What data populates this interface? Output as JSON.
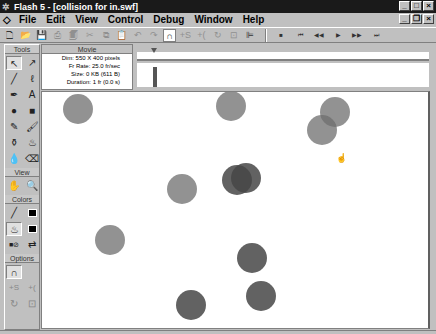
{
  "window": {
    "title": "Flash 5 - [collision for in.swf]",
    "controls": [
      "_",
      "□",
      "×"
    ],
    "doc_controls": [
      "_",
      "❐",
      "×"
    ]
  },
  "menu": {
    "items": [
      "File",
      "Edit",
      "View",
      "Control",
      "Debug",
      "Window",
      "Help"
    ]
  },
  "toolbar": {
    "buttons": [
      {
        "name": "new-icon",
        "glyph": "🗋"
      },
      {
        "name": "open-icon",
        "glyph": "📂"
      },
      {
        "name": "save-icon",
        "glyph": "💾"
      },
      {
        "name": "print-icon",
        "glyph": "⎙"
      },
      {
        "name": "print-preview-icon",
        "glyph": "🗐"
      },
      {
        "name": "cut-icon",
        "glyph": "✂"
      },
      {
        "name": "copy-icon",
        "glyph": "⧉"
      },
      {
        "name": "paste-icon",
        "glyph": "📋"
      },
      {
        "name": "undo-icon",
        "glyph": "↶"
      },
      {
        "name": "redo-icon",
        "glyph": "↷"
      },
      {
        "name": "snap-magnet-icon",
        "glyph": "∩"
      },
      {
        "name": "smooth-icon",
        "glyph": "+S"
      },
      {
        "name": "straighten-icon",
        "glyph": "+("
      },
      {
        "name": "rotate-icon",
        "glyph": "↻"
      },
      {
        "name": "scale-icon",
        "glyph": "⊡"
      },
      {
        "name": "align-icon",
        "glyph": "⊫"
      }
    ],
    "controller": [
      {
        "name": "stop-icon",
        "glyph": "■"
      },
      {
        "name": "rewind-icon",
        "glyph": "⏮"
      },
      {
        "name": "step-back-icon",
        "glyph": "◀◀"
      },
      {
        "name": "play-icon",
        "glyph": "▶"
      },
      {
        "name": "step-forward-icon",
        "glyph": "▶▶"
      },
      {
        "name": "go-to-end-icon",
        "glyph": "⏭"
      }
    ]
  },
  "tools": {
    "header": "Tools",
    "items": [
      {
        "name": "arrow-tool-icon",
        "glyph": "↖",
        "selected": true
      },
      {
        "name": "subselect-tool-icon",
        "glyph": "↗"
      },
      {
        "name": "line-tool-icon",
        "glyph": "╱"
      },
      {
        "name": "lasso-tool-icon",
        "glyph": "ℓ"
      },
      {
        "name": "pen-tool-icon",
        "glyph": "✒"
      },
      {
        "name": "text-tool-icon",
        "glyph": "A"
      },
      {
        "name": "oval-tool-icon",
        "glyph": "●"
      },
      {
        "name": "rectangle-tool-icon",
        "glyph": "■"
      },
      {
        "name": "pencil-tool-icon",
        "glyph": "✎"
      },
      {
        "name": "brush-tool-icon",
        "glyph": "🖌"
      },
      {
        "name": "ink-bottle-tool-icon",
        "glyph": "⚱"
      },
      {
        "name": "paint-bucket-tool-icon",
        "glyph": "♨"
      },
      {
        "name": "eyedropper-tool-icon",
        "glyph": "💧"
      },
      {
        "name": "eraser-tool-icon",
        "glyph": "⌫"
      }
    ],
    "view_header": "View",
    "view_items": [
      {
        "name": "hand-tool-icon",
        "glyph": "✋"
      },
      {
        "name": "zoom-tool-icon",
        "glyph": "🔍"
      }
    ],
    "colors_header": "Colors",
    "options_header": "Options"
  },
  "info": {
    "header": "Movie",
    "lines": [
      "Dim: 550 X 400 pixels",
      "Fr Rate: 25.0 fr/sec",
      "Size: 0 KB (611 B)",
      "Duration: 1 fr (0.0 s)"
    ]
  },
  "stage": {
    "balls": [
      {
        "x": 36,
        "y": 17,
        "dark": false
      },
      {
        "x": 189,
        "y": 14,
        "dark": false
      },
      {
        "x": 293,
        "y": 20,
        "dark": false
      },
      {
        "x": 280,
        "y": 38,
        "dark": false
      },
      {
        "x": 195,
        "y": 88,
        "dark": true
      },
      {
        "x": 204,
        "y": 86,
        "dark": true
      },
      {
        "x": 140,
        "y": 97,
        "dark": false
      },
      {
        "x": 68,
        "y": 148,
        "dark": false
      },
      {
        "x": 210,
        "y": 166,
        "dark": true
      },
      {
        "x": 219,
        "y": 204,
        "dark": true
      },
      {
        "x": 149,
        "y": 213,
        "dark": true
      }
    ],
    "cursor": {
      "x": 294,
      "y": 61,
      "glyph": "☝"
    }
  }
}
